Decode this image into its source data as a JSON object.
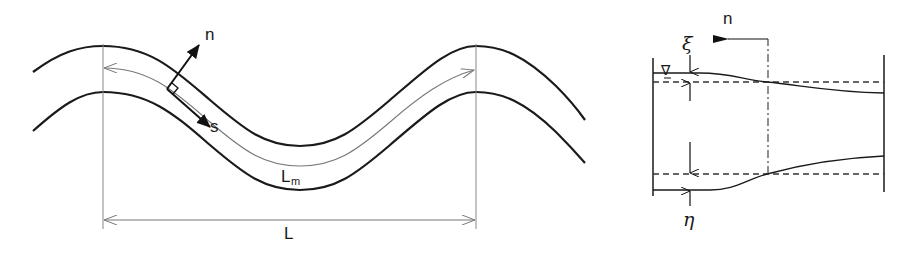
{
  "left_figure": {
    "title": "Meandering channel plan view",
    "labels": {
      "normal_axis": "n",
      "streamwise_axis": "s",
      "meander_length": "L",
      "meander_length_sub": "m",
      "wavelength": "L"
    }
  },
  "right_figure": {
    "title": "Channel cross-section",
    "labels": {
      "section_direction": "n",
      "water_surface_disp": "ξ",
      "bed_disp": "η",
      "water_level_symbol": "∇"
    }
  },
  "colors": {
    "line": "#1a1a1a",
    "thin_line": "#777777",
    "background": "#ffffff"
  }
}
